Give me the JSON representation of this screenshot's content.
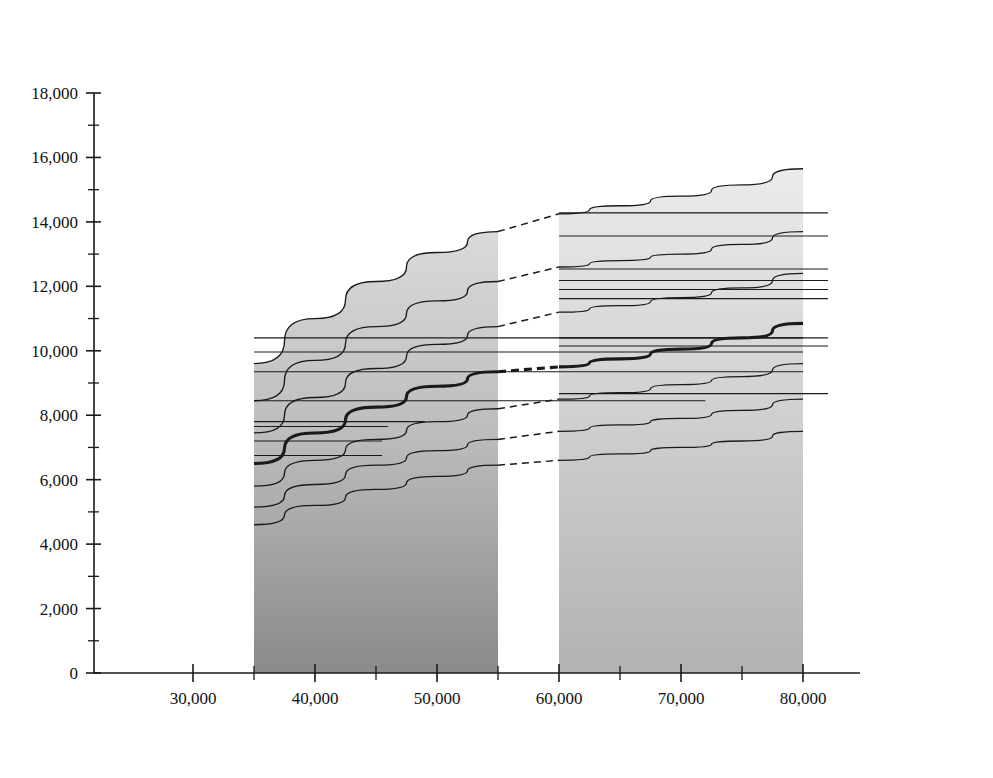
{
  "figure": {
    "caption": "(a)",
    "y_axis_title_line1": "SMCR power",
    "y_axis_title_line2": "kW",
    "x_axis_title": "Deadweight of ship at scantling draught, dwt",
    "x_axis_title_sub": "scant",
    "x_axis_unit": "dwt",
    "average_speed_label_line1": "Average",
    "average_speed_label_line2": "ship speed"
  },
  "chart_data": {
    "type": "line",
    "xlabel": "Deadweight of ship at scantling draught, dwt_scant",
    "ylabel": "SMCR power, kW",
    "xlim": [
      22000,
      84000
    ],
    "ylim": [
      0,
      18000
    ],
    "grid": false,
    "legend_position": "inside-lower-right",
    "x_ticks": [
      30000,
      40000,
      50000,
      60000,
      70000,
      80000
    ],
    "x_tick_labels": [
      "30,000",
      "40,000",
      "50,000",
      "60,000",
      "70,000",
      "80,000"
    ],
    "x_minor_tick_step": 5000,
    "y_ticks": [
      0,
      2000,
      4000,
      6000,
      8000,
      10000,
      12000,
      14000,
      16000,
      18000
    ],
    "y_tick_labels": [
      "0",
      "2,000",
      "4,000",
      "6,000",
      "8,000",
      "10,000",
      "12,000",
      "14,000",
      "16,000",
      "18,000"
    ],
    "y_minor_tick_step": 1000,
    "regions": [
      {
        "name": "Handymax",
        "x_start": 35000,
        "x_end": 55000,
        "shade": "dark-gradient"
      },
      {
        "name": "Panamax",
        "x_start": 60000,
        "x_end": 80000,
        "shade": "light-gradient"
      }
    ],
    "series": [
      {
        "name": "16.0 kn",
        "speed": 16.0,
        "points_handymax": [
          [
            35000,
            9600
          ],
          [
            40000,
            11000
          ],
          [
            45000,
            12150
          ],
          [
            50000,
            13050
          ],
          [
            55000,
            13700
          ]
        ],
        "points_panamax": [
          [
            60000,
            14250
          ],
          [
            65000,
            14500
          ],
          [
            70000,
            14800
          ],
          [
            75000,
            15150
          ],
          [
            80000,
            15650
          ]
        ]
      },
      {
        "name": "15.5 kn",
        "speed": 15.5,
        "points_handymax": [
          [
            35000,
            8450
          ],
          [
            40000,
            9700
          ],
          [
            45000,
            10750
          ],
          [
            50000,
            11550
          ],
          [
            55000,
            12150
          ]
        ],
        "points_panamax": [
          [
            60000,
            12600
          ],
          [
            65000,
            12800
          ],
          [
            70000,
            13000
          ],
          [
            75000,
            13300
          ],
          [
            80000,
            13700
          ]
        ]
      },
      {
        "name": "15.0 kn",
        "speed": 15.0,
        "points_handymax": [
          [
            35000,
            7450
          ],
          [
            40000,
            8550
          ],
          [
            45000,
            9450
          ],
          [
            50000,
            10200
          ],
          [
            55000,
            10750
          ]
        ],
        "points_panamax": [
          [
            60000,
            11200
          ],
          [
            65000,
            11400
          ],
          [
            70000,
            11650
          ],
          [
            75000,
            11950
          ],
          [
            80000,
            12400
          ]
        ]
      },
      {
        "name": "14.5 kn",
        "speed": 14.5,
        "is_average_ship_speed": true,
        "emphasis": "thick",
        "points_handymax": [
          [
            35000,
            6500
          ],
          [
            40000,
            7450
          ],
          [
            45000,
            8250
          ],
          [
            50000,
            8900
          ],
          [
            55000,
            9350
          ]
        ],
        "points_panamax": [
          [
            60000,
            9500
          ],
          [
            65000,
            9750
          ],
          [
            70000,
            10050
          ],
          [
            75000,
            10400
          ],
          [
            80000,
            10850
          ]
        ]
      },
      {
        "name": "14.0 kn",
        "speed": 14.0,
        "points_handymax": [
          [
            35000,
            5800
          ],
          [
            40000,
            6600
          ],
          [
            45000,
            7250
          ],
          [
            50000,
            7800
          ],
          [
            55000,
            8200
          ]
        ],
        "points_panamax": [
          [
            60000,
            8500
          ],
          [
            65000,
            8700
          ],
          [
            70000,
            8950
          ],
          [
            75000,
            9200
          ],
          [
            80000,
            9600
          ]
        ]
      },
      {
        "name": "13.5 kn",
        "speed": 13.5,
        "points_handymax": [
          [
            35000,
            5150
          ],
          [
            40000,
            5850
          ],
          [
            45000,
            6450
          ],
          [
            50000,
            6900
          ],
          [
            55000,
            7250
          ]
        ],
        "points_panamax": [
          [
            60000,
            7500
          ],
          [
            65000,
            7700
          ],
          [
            70000,
            7900
          ],
          [
            75000,
            8150
          ],
          [
            80000,
            8500
          ]
        ]
      },
      {
        "name": "13.0 kn",
        "speed": 13.0,
        "points_handymax": [
          [
            35000,
            4600
          ],
          [
            40000,
            5200
          ],
          [
            45000,
            5700
          ],
          [
            50000,
            6100
          ],
          [
            55000,
            6450
          ]
        ],
        "points_panamax": [
          [
            60000,
            6600
          ],
          [
            65000,
            6800
          ],
          [
            70000,
            7000
          ],
          [
            75000,
            7200
          ],
          [
            80000,
            7500
          ]
        ]
      }
    ],
    "speed_labels": [
      {
        "text": "16.0 kn",
        "value": 16.0,
        "y_kw": 14250
      },
      {
        "text": "15.5 kn",
        "value": 15.5,
        "y_kw": 12600
      },
      {
        "text": "15.0 kn",
        "value": 15.0,
        "y_kw": 11200
      },
      {
        "text": "14.5 kn",
        "value": 14.5,
        "y_kw": 9500
      },
      {
        "text": "14.0 kn",
        "value": 14.0,
        "y_kw": 8500
      },
      {
        "text": "13.5 kn",
        "value": 13.5,
        "y_kw": 7500
      },
      {
        "text": "13.0 kn",
        "value": 13.0,
        "y_kw": 6600
      }
    ],
    "engine_labels_left": [
      {
        "text": "7S50MC-C7",
        "power_kw": 10750,
        "line_end_dwt": 35000
      },
      {
        "text": "6S50ME-B9",
        "power_kw": 10400,
        "line_end_dwt": 80000
      },
      {
        "text": "6S50MC-C8/ME-B8",
        "power_kw": 9960,
        "line_end_dwt": 80000
      },
      {
        "text": "6S50MC-C7",
        "power_kw": 9350,
        "line_end_dwt": 80000
      },
      {
        "text": "6S50MC6",
        "power_kw": 8450,
        "line_end_dwt": 72000
      },
      {
        "text": "5S50MC-C7",
        "power_kw": 7800,
        "line_end_dwt": 49000
      },
      {
        "text": "6S46MC-C7",
        "power_kw": 7650,
        "line_end_dwt": 46000
      },
      {
        "text": "5S50MC6",
        "power_kw": 7200,
        "line_end_dwt": 45500
      },
      {
        "text": "6S40ME-B9",
        "power_kw": 6750,
        "line_end_dwt": 45500
      }
    ],
    "engine_labels_right": [
      {
        "text": "6S60MC-C8/ME-C8",
        "power_kw": 14280
      },
      {
        "text": "6S60MC-C7/ME-C7",
        "power_kw": 13560
      },
      {
        "text": "7S50ME-B9",
        "power_kw": 12540
      },
      {
        "text": "6S60MC6",
        "power_kw": 12180
      },
      {
        "text": "5S60MC-C8/ME-C8",
        "power_kw": 11900
      },
      {
        "text": "7S50ME-C8/ME-B8",
        "power_kw": 11620
      },
      {
        "text": "6S50ME-B9",
        "power_kw": 10400
      },
      {
        "text": "5S60MC6",
        "power_kw": 10150
      },
      {
        "text": "5S50ME-B9",
        "power_kw": 8670
      }
    ],
    "markers": [
      {
        "symbol": "dot",
        "label": "Kamsarmax",
        "x_dwt": 80500,
        "y_kw": 10900
      },
      {
        "symbol": "cross",
        "label": "Alt. Handymax, 14.5 kn",
        "x_dwt": 35000,
        "y_kw": 6750
      }
    ],
    "legend_entries": [
      {
        "symbol": "•",
        "text": "Kamsarmax"
      },
      {
        "symbol": "×",
        "text": "Alt. Handymax, 14.5 kn"
      },
      {
        "symbol": "",
        "text": "(St. Lawrence canal)"
      }
    ],
    "region_labels": [
      {
        "text": "Handymax",
        "x_dwt": 43000,
        "y_kw": 15000
      },
      {
        "text": "Panamax",
        "x_dwt": 69000,
        "y_kw": 15800
      }
    ]
  },
  "colors": {
    "axis": "#1a1a1a",
    "curve": "#1a1a1a",
    "handymax_shade_top": "#d6d6d6",
    "handymax_shade_bottom": "#8d8d8d",
    "panamax_shade_top": "#e6e6e6",
    "panamax_shade_bottom": "#b5b5b5",
    "text": "#111111"
  }
}
